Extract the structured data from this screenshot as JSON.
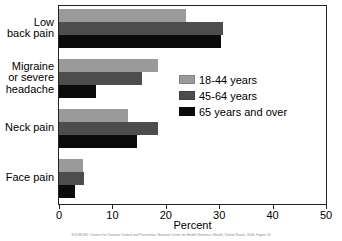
{
  "chart_data": {
    "type": "bar",
    "orientation": "horizontal",
    "title": "",
    "xlabel": "Percent",
    "ylabel": "",
    "xlim": [
      0,
      50
    ],
    "xticks": [
      0,
      10,
      20,
      30,
      40,
      50
    ],
    "grid": false,
    "legend_position": "center-right",
    "categories": [
      "Low\nback pain",
      "Migraine\nor severe\nheadache",
      "Neck pain",
      "Face pain"
    ],
    "series": [
      {
        "name": "18-44 years",
        "color": "#9a9a9a",
        "values": [
          23.8,
          18.6,
          13.0,
          4.5
        ]
      },
      {
        "name": "45-64 years",
        "color": "#4d4d4d",
        "values": [
          30.7,
          15.6,
          18.6,
          4.6
        ]
      },
      {
        "name": "65 years and over",
        "color": "#0b0b0b",
        "values": [
          30.3,
          7.0,
          14.7,
          3.0
        ]
      }
    ]
  },
  "axis": {
    "tick_labels": [
      "0",
      "10",
      "20",
      "30",
      "40",
      "50"
    ],
    "x_title": "Percent"
  },
  "legend": {
    "items": [
      {
        "label": "18-44 years"
      },
      {
        "label": "45-64 years"
      },
      {
        "label": "65 years and over"
      }
    ]
  },
  "source": {
    "note": "SOURCES: Centers for Disease Control and Prevention, National Center for Health Statistics, Health, United States, 2006, Figure 20"
  }
}
